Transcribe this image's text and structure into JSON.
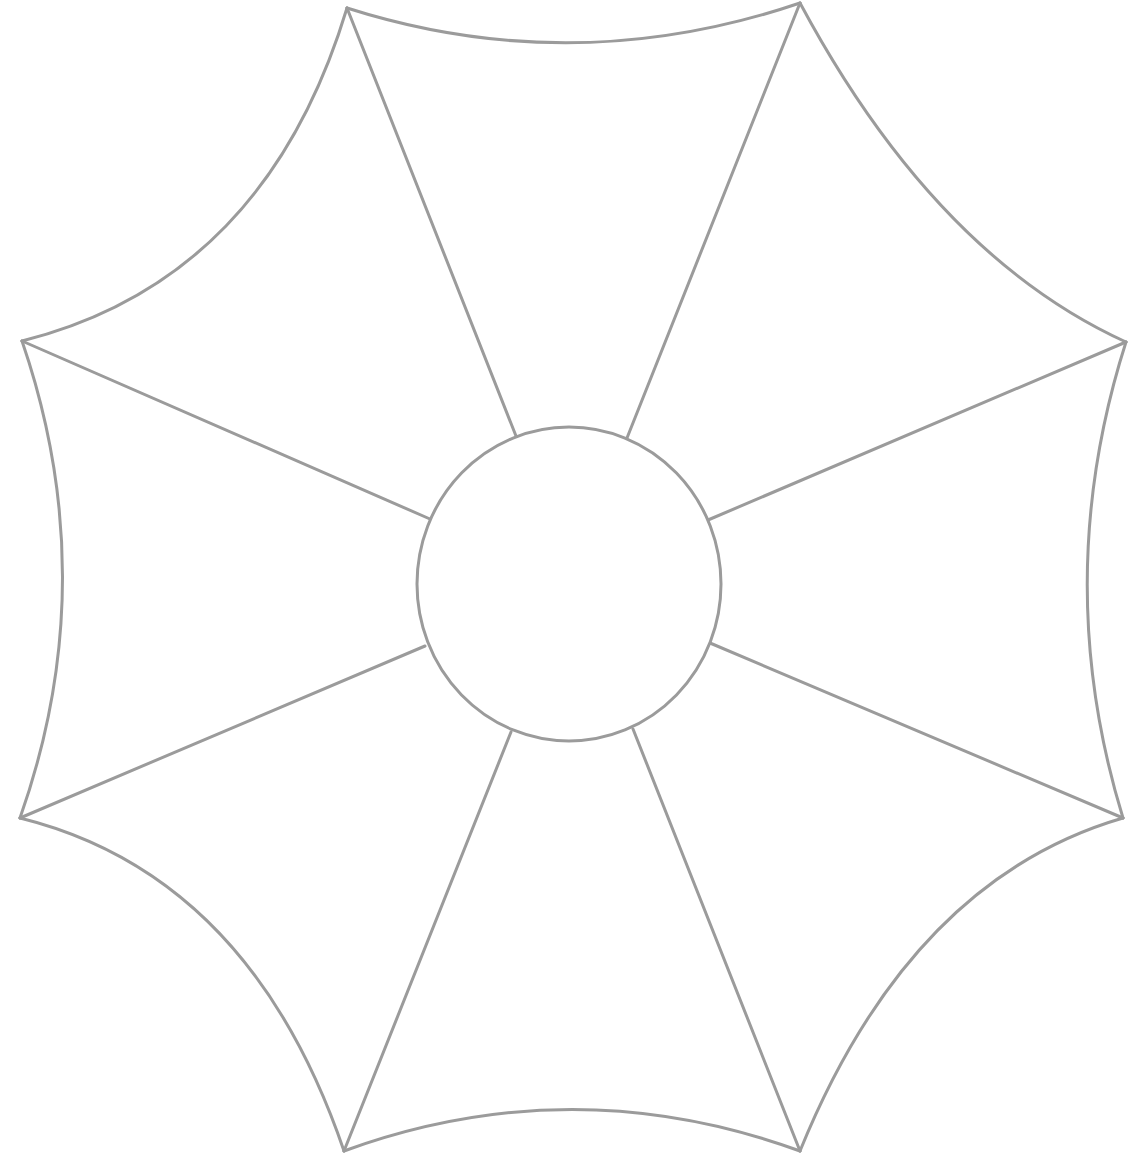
{
  "diagram": {
    "title": "",
    "background": "#ffffff",
    "stroke_color": "#9b9b9b",
    "stroke_width": 3,
    "center": {
      "cx": 569,
      "cy": 584,
      "rx": 152,
      "ry": 157
    },
    "vertices": [
      {
        "name": "top-left",
        "x": 347,
        "y": 8
      },
      {
        "name": "top-right",
        "x": 800,
        "y": 3
      },
      {
        "name": "right-top",
        "x": 1126,
        "y": 342
      },
      {
        "name": "right-bottom",
        "x": 1123,
        "y": 818
      },
      {
        "name": "bottom-right",
        "x": 800,
        "y": 1151
      },
      {
        "name": "bottom-left",
        "x": 344,
        "y": 1151
      },
      {
        "name": "left-bottom",
        "x": 20,
        "y": 818
      },
      {
        "name": "left-top",
        "x": 22,
        "y": 341
      }
    ],
    "edge_paths": [
      "M347,8 Q573,80 800,3",
      "M800,3 Q935,255 1126,342",
      "M1126,342 Q1050,580 1123,818",
      "M1123,818 Q910,880 800,1151",
      "M800,1151 Q572,1068 344,1151",
      "M344,1151 Q250,875 20,818",
      "M20,818 Q104,580 22,341",
      "M22,341 Q265,280 347,8"
    ],
    "spokes": [
      {
        "x1": 347,
        "y1": 8,
        "x2": 516,
        "y2": 436
      },
      {
        "x1": 800,
        "y1": 3,
        "x2": 627,
        "y2": 438
      },
      {
        "x1": 1126,
        "y1": 342,
        "x2": 708,
        "y2": 520
      },
      {
        "x1": 1123,
        "y1": 818,
        "x2": 710,
        "y2": 643
      },
      {
        "x1": 800,
        "y1": 1151,
        "x2": 633,
        "y2": 729
      },
      {
        "x1": 344,
        "y1": 1151,
        "x2": 511,
        "y2": 732
      },
      {
        "x1": 20,
        "y1": 818,
        "x2": 425,
        "y2": 646
      },
      {
        "x1": 22,
        "y1": 341,
        "x2": 430,
        "y2": 519
      }
    ]
  }
}
